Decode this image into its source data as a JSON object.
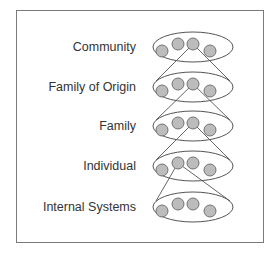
{
  "diagram": {
    "type": "nested-systems",
    "levels": [
      {
        "label": "Community",
        "y": 47,
        "connector_from_circle": 2
      },
      {
        "label": "Family of Origin",
        "y": 87,
        "connector_from_circle": 2
      },
      {
        "label": "Family",
        "y": 126,
        "connector_from_circle": 2
      },
      {
        "label": "Individual",
        "y": 166,
        "connector_from_circle": 1
      },
      {
        "label": "Internal Systems",
        "y": 207,
        "connector_from_circle": null
      }
    ],
    "circles_per_level": 4,
    "colors": {
      "frame": "#7a7a7a",
      "ellipse_stroke": "#555555",
      "circle_fill": "#bcbcbc",
      "circle_stroke": "#666666",
      "line": "#555555",
      "text": "#333333"
    }
  }
}
